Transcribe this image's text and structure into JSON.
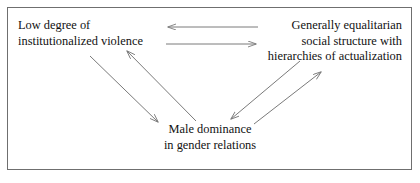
{
  "figure": {
    "background_color": "#ffffff",
    "border_color": "#6f6f6f",
    "line_color": "#7a7a7a",
    "text_color": "#111111"
  },
  "nodes": {
    "violence": {
      "id": "low-institutionalized-violence",
      "line1": "Low degree of",
      "line2": "institutionalized violence",
      "align": "left"
    },
    "structure": {
      "id": "equalitarian-social-structure",
      "line1": "Generally equalitarian",
      "line2": "social structure with",
      "line3": "hierarchies of actualization",
      "align": "right"
    },
    "dominance": {
      "id": "male-dominance-gender-relations",
      "line1": "Male dominance",
      "line2": "in gender relations",
      "align": "center"
    }
  },
  "arrows": [
    {
      "name": "arrow-structure-to-violence",
      "from": "structure",
      "to": "violence",
      "direction": "left",
      "x1": 258,
      "y1": 27,
      "x2": 168,
      "y2": 27
    },
    {
      "name": "arrow-violence-to-structure",
      "from": "violence",
      "to": "structure",
      "direction": "right",
      "x1": 166,
      "y1": 44,
      "x2": 256,
      "y2": 44
    },
    {
      "name": "arrow-violence-to-dominance",
      "from": "violence",
      "to": "dominance",
      "direction": "down-right",
      "x1": 90,
      "y1": 56,
      "x2": 158,
      "y2": 122
    },
    {
      "name": "arrow-dominance-to-violence",
      "from": "dominance",
      "to": "violence",
      "direction": "up-left",
      "x1": 196,
      "y1": 121,
      "x2": 127,
      "y2": 51
    },
    {
      "name": "arrow-structure-to-dominance",
      "from": "structure",
      "to": "dominance",
      "direction": "down-left",
      "x1": 300,
      "y1": 61,
      "x2": 231,
      "y2": 119
    },
    {
      "name": "arrow-dominance-to-structure",
      "from": "dominance",
      "to": "structure",
      "direction": "up-right",
      "x1": 254,
      "y1": 124,
      "x2": 321,
      "y2": 72
    }
  ]
}
